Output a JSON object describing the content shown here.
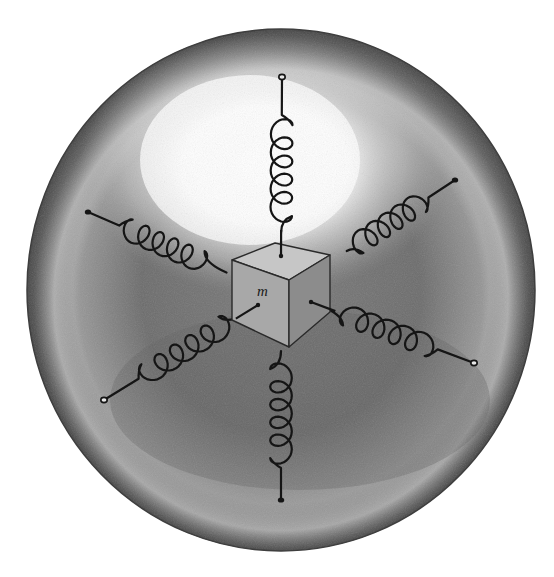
{
  "figure": {
    "mass_label": "m",
    "colors": {
      "background": "#ffffff",
      "sphere_dark": "#4a4a4a",
      "sphere_mid": "#8a8a8a",
      "sphere_highlight": "#ffffff",
      "spring": "#151515",
      "cube_top": "#c9c9c9",
      "cube_front": "#a9a9a9",
      "cube_side": "#8e8e8e"
    },
    "sphere": {
      "cx": 281,
      "cy": 290,
      "rx": 254,
      "ry": 261
    },
    "cube": {
      "top_left": [
        232,
        260
      ],
      "top_back": [
        275,
        243
      ],
      "top_right": [
        330,
        255
      ],
      "top_front": [
        289,
        280
      ],
      "bottom_left": [
        232,
        320
      ],
      "bottom_front": [
        289,
        347
      ],
      "bottom_right": [
        330,
        312
      ]
    },
    "springs": [
      {
        "name": "top",
        "anchor": [
          281,
          256
        ],
        "end": [
          282,
          77
        ],
        "end_style": "open-circle"
      },
      {
        "name": "bottom",
        "anchor": [
          281,
          347
        ],
        "end": [
          281,
          500
        ],
        "end_style": "filled-dot"
      },
      {
        "name": "upper-left",
        "anchor": [
          232,
          275
        ],
        "end": [
          88,
          212
        ],
        "end_style": "filled-dot"
      },
      {
        "name": "upper-right",
        "anchor": [
          330,
          262
        ],
        "end": [
          455,
          180
        ],
        "end_style": "filled-dot"
      },
      {
        "name": "lower-right",
        "anchor": [
          311,
          302
        ],
        "end": [
          474,
          363
        ],
        "end_style": "open-circle"
      },
      {
        "name": "lower-left",
        "anchor": [
          258,
          305
        ],
        "end": [
          104,
          400
        ],
        "end_style": "open-circle"
      }
    ]
  }
}
